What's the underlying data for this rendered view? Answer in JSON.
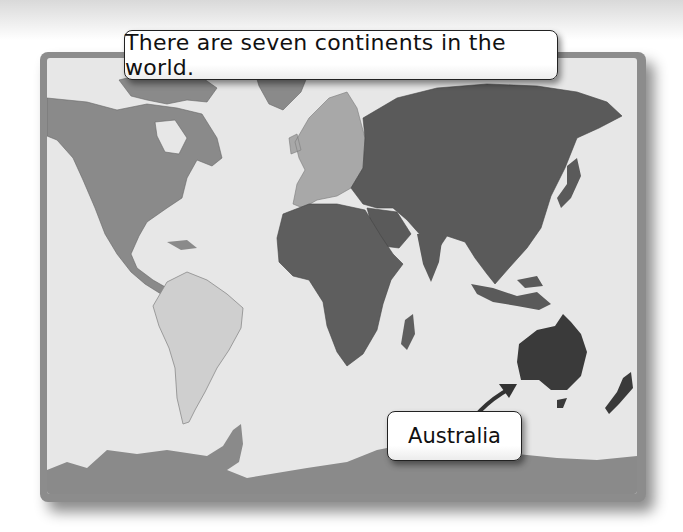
{
  "caption": "There are seven continents in the world.",
  "label": "Australia",
  "map": {
    "title": "World map of continents",
    "continents": [
      {
        "name": "North America",
        "shade": "#8a8a8a"
      },
      {
        "name": "South America",
        "shade": "#cfcfcf"
      },
      {
        "name": "Europe",
        "shade": "#a8a8a8"
      },
      {
        "name": "Africa",
        "shade": "#5e5e5e"
      },
      {
        "name": "Asia",
        "shade": "#5a5a5a"
      },
      {
        "name": "Australia",
        "shade": "#3a3a3a",
        "highlighted": true
      },
      {
        "name": "Antarctica",
        "shade": "#8a8a8a"
      }
    ],
    "ocean_color": "#e7e7e7",
    "frame_color": "#8c8c8c"
  }
}
